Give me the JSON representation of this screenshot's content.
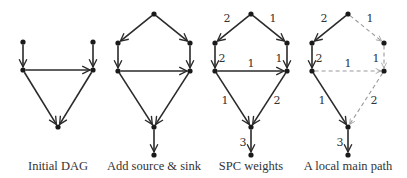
{
  "panels": [
    {
      "id": "initial",
      "caption": "Initial DAG",
      "caption_x": 58,
      "nodes": [
        [
          23,
          42
        ],
        [
          93,
          42
        ],
        [
          23,
          70
        ],
        [
          93,
          70
        ],
        [
          58,
          127
        ]
      ],
      "edges": [
        {
          "from": 0,
          "to": 2,
          "style": "solid"
        },
        {
          "from": 1,
          "to": 3,
          "style": "solid"
        },
        {
          "from": 2,
          "to": 3,
          "style": "solid"
        },
        {
          "from": 2,
          "to": 4,
          "style": "solid"
        },
        {
          "from": 3,
          "to": 4,
          "style": "solid"
        }
      ]
    },
    {
      "id": "source-sink",
      "caption": "Add source & sink",
      "caption_x": 154,
      "nodes": [
        [
          154,
          14
        ],
        [
          118,
          43
        ],
        [
          190,
          43
        ],
        [
          118,
          71
        ],
        [
          190,
          71
        ],
        [
          154,
          127
        ],
        [
          154,
          155
        ]
      ],
      "edges": [
        {
          "from": 0,
          "to": 1,
          "style": "solid"
        },
        {
          "from": 0,
          "to": 2,
          "style": "solid"
        },
        {
          "from": 1,
          "to": 3,
          "style": "solid"
        },
        {
          "from": 2,
          "to": 4,
          "style": "solid"
        },
        {
          "from": 3,
          "to": 4,
          "style": "solid"
        },
        {
          "from": 3,
          "to": 5,
          "style": "solid"
        },
        {
          "from": 4,
          "to": 5,
          "style": "solid"
        },
        {
          "from": 5,
          "to": 6,
          "style": "solid"
        }
      ]
    },
    {
      "id": "spc",
      "caption": "SPC weights",
      "caption_x": 251,
      "nodes": [
        [
          251,
          14
        ],
        [
          215,
          43
        ],
        [
          287,
          43
        ],
        [
          215,
          71
        ],
        [
          287,
          71
        ],
        [
          251,
          127
        ],
        [
          251,
          155
        ]
      ],
      "edges": [
        {
          "from": 0,
          "to": 1,
          "style": "solid",
          "w": "2",
          "lx": 227,
          "ly": 22
        },
        {
          "from": 0,
          "to": 2,
          "style": "solid",
          "w": "1",
          "lx": 273,
          "ly": 22
        },
        {
          "from": 1,
          "to": 3,
          "style": "solid",
          "w": "2",
          "lx": 222,
          "ly": 62
        },
        {
          "from": 2,
          "to": 4,
          "style": "solid",
          "w": "1",
          "lx": 279,
          "ly": 62
        },
        {
          "from": 3,
          "to": 4,
          "style": "solid",
          "w": "1",
          "lx": 251,
          "ly": 67
        },
        {
          "from": 3,
          "to": 5,
          "style": "solid",
          "w": "1",
          "lx": 225,
          "ly": 104
        },
        {
          "from": 4,
          "to": 5,
          "style": "solid",
          "w": "2",
          "lx": 277,
          "ly": 104
        },
        {
          "from": 5,
          "to": 6,
          "style": "solid",
          "w": "3",
          "lx": 243,
          "ly": 146
        }
      ]
    },
    {
      "id": "main-path",
      "caption": "A local main path",
      "caption_x": 348,
      "nodes": [
        [
          348,
          14
        ],
        [
          312,
          43
        ],
        [
          384,
          43
        ],
        [
          312,
          71
        ],
        [
          384,
          71
        ],
        [
          348,
          127
        ],
        [
          348,
          155
        ]
      ],
      "edges": [
        {
          "from": 0,
          "to": 1,
          "style": "solid",
          "w": "2",
          "lx": 324,
          "ly": 22
        },
        {
          "from": 0,
          "to": 2,
          "style": "dashed",
          "w": "1",
          "lx": 370,
          "ly": 22
        },
        {
          "from": 1,
          "to": 3,
          "style": "solid",
          "w": "2",
          "lx": 319,
          "ly": 62
        },
        {
          "from": 2,
          "to": 4,
          "style": "dashed",
          "w": "1",
          "lx": 376,
          "ly": 62
        },
        {
          "from": 3,
          "to": 4,
          "style": "dashed",
          "w": "1",
          "lx": 348,
          "ly": 67
        },
        {
          "from": 3,
          "to": 5,
          "style": "solid",
          "w": "1",
          "lx": 322,
          "ly": 104
        },
        {
          "from": 4,
          "to": 5,
          "style": "dashed",
          "w": "2",
          "lx": 374,
          "ly": 104
        },
        {
          "from": 5,
          "to": 6,
          "style": "solid",
          "w": "3",
          "lx": 340,
          "ly": 146
        }
      ]
    }
  ],
  "caption_y": 166
}
